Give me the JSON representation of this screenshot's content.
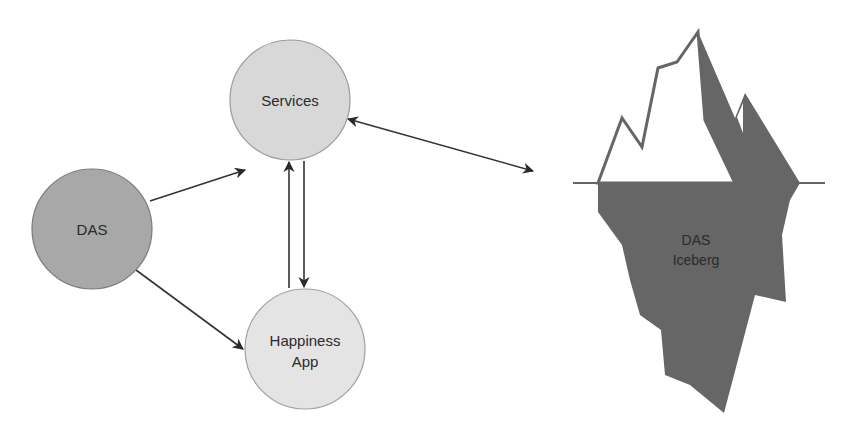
{
  "diagram": {
    "nodes": [
      {
        "id": "services",
        "label_lines": [
          "Services"
        ],
        "fill": "#d8d8d8"
      },
      {
        "id": "das",
        "label_lines": [
          "DAS"
        ],
        "fill": "#a8a8a8"
      },
      {
        "id": "happiness_app",
        "label_lines": [
          "Happiness",
          "App"
        ],
        "fill": "#e4e4e4"
      }
    ],
    "edges": [
      {
        "from": "das",
        "to": "services",
        "direction": "forward"
      },
      {
        "from": "das",
        "to": "happiness_app",
        "direction": "forward"
      },
      {
        "from": "happiness_app",
        "to": "services",
        "direction": "forward"
      },
      {
        "from": "services",
        "to": "happiness_app",
        "direction": "forward"
      },
      {
        "from": "services",
        "to": "das_iceberg",
        "direction": "both"
      }
    ],
    "iceberg": {
      "id": "das_iceberg",
      "label_lines": [
        "DAS",
        "Iceberg"
      ],
      "dark_color": "#666666",
      "light_color": "#ffffff"
    }
  }
}
